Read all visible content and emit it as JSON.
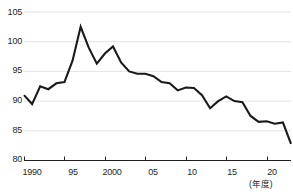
{
  "chart_data": {
    "type": "line",
    "title": "",
    "xlabel": "(年度)",
    "ylabel": "",
    "ylim": [
      80,
      105
    ],
    "xlim": [
      1990,
      2023
    ],
    "grid": true,
    "legend": null,
    "yticks": [
      80,
      85,
      90,
      95,
      100,
      105
    ],
    "ytick_labels": [
      "80",
      "85",
      "90",
      "95",
      "100",
      "105"
    ],
    "xticks": [
      1990,
      1995,
      2000,
      2005,
      2010,
      2015,
      2020
    ],
    "xtick_labels": [
      "1990",
      "95",
      "2000",
      "05",
      "10",
      "15",
      "20"
    ],
    "series": [
      {
        "name": "index",
        "line_color": "#1a1a1a",
        "x": [
          1990,
          1991,
          1992,
          1993,
          1994,
          1995,
          1996,
          1997,
          1998,
          1999,
          2000,
          2001,
          2002,
          2003,
          2004,
          2005,
          2006,
          2007,
          2008,
          2009,
          2010,
          2011,
          2012,
          2013,
          2014,
          2015,
          2016,
          2017,
          2018,
          2019,
          2020,
          2021,
          2022,
          2023
        ],
        "values": [
          91.0,
          89.5,
          92.5,
          92.0,
          93.0,
          93.2,
          96.8,
          102.5,
          99.0,
          96.3,
          98.0,
          99.2,
          96.5,
          95.0,
          94.6,
          94.6,
          94.2,
          93.2,
          93.0,
          91.8,
          92.3,
          92.2,
          91.0,
          88.8,
          90.0,
          90.8,
          90.0,
          89.8,
          87.5,
          86.5,
          86.6,
          86.2,
          86.4,
          82.8
        ]
      }
    ]
  },
  "axis": {
    "axis_color": "#231f20",
    "grid_color": "#e3e3e3"
  }
}
